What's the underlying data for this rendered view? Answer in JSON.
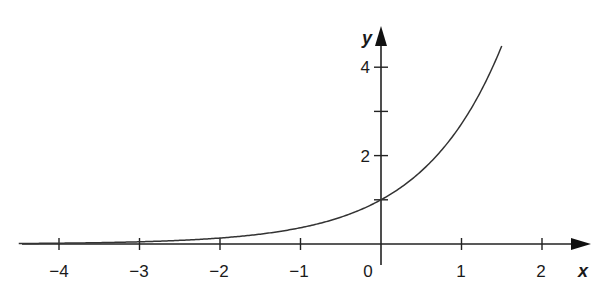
{
  "chart_data": {
    "type": "line",
    "title": "",
    "function": "y = e^x",
    "xlabel": "x",
    "ylabel": "y",
    "xlim": [
      -4.5,
      2.4
    ],
    "ylim": [
      0,
      4.7
    ],
    "grid": false,
    "legend": null,
    "x_ticks": [
      -4,
      -3,
      -2,
      -1,
      0,
      1,
      2
    ],
    "x_tick_labels": [
      "−4",
      "−3",
      "−2",
      "−1",
      "0",
      "1",
      "2"
    ],
    "y_ticks": [
      1,
      2,
      3,
      4
    ],
    "y_tick_labels": [
      "",
      "2",
      "",
      "4"
    ],
    "series": [
      {
        "name": "e^x",
        "x": [
          -4.5,
          -4,
          -3.5,
          -3,
          -2.5,
          -2,
          -1.5,
          -1,
          -0.5,
          0,
          0.25,
          0.5,
          0.75,
          1,
          1.25,
          1.5
        ],
        "values": [
          0.011,
          0.018,
          0.03,
          0.05,
          0.082,
          0.135,
          0.223,
          0.368,
          0.607,
          1.0,
          1.284,
          1.649,
          2.117,
          2.718,
          3.49,
          4.482
        ]
      }
    ]
  },
  "labels": {
    "x_axis": "x",
    "y_axis": "y",
    "x_ticks": [
      "−4",
      "−3",
      "−2",
      "−1",
      "0",
      "1",
      "2"
    ],
    "y_ticks": [
      "2",
      "4"
    ]
  }
}
